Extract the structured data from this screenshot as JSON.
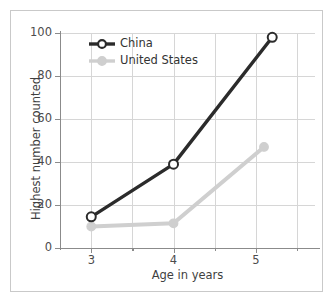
{
  "chart_data": {
    "type": "line",
    "title": "",
    "xlabel": "Age in years",
    "ylabel": "Highest number counted",
    "x": [
      3,
      4,
      5.2
    ],
    "xlim": [
      2.62,
      5.72
    ],
    "ylim": [
      0,
      100
    ],
    "xticks": [
      3,
      4,
      5
    ],
    "xticklabels": [
      "3",
      "4",
      "5"
    ],
    "xticks_minor": [
      3.5,
      4.5,
      5.5
    ],
    "yticks": [
      0,
      20,
      40,
      60,
      80,
      100
    ],
    "yticklabels": [
      "0",
      "20",
      "40",
      "60",
      "80",
      "100"
    ],
    "grid": true,
    "grid_axis": "both",
    "legend_position": "upper left",
    "series": [
      {
        "name": "China",
        "x": [
          3,
          4,
          5.2
        ],
        "values": [
          14.5,
          39,
          98
        ],
        "color": "#2b2b2b",
        "marker": "open-circle"
      },
      {
        "name": "United States",
        "x": [
          3,
          4,
          5.1
        ],
        "values": [
          10,
          11.5,
          47
        ],
        "color": "#cfcfcf",
        "marker": "filled-circle"
      }
    ]
  },
  "legend": {
    "entries": [
      {
        "label": "China"
      },
      {
        "label": "United States"
      }
    ]
  },
  "axes": {
    "y_title": "Highest number counted",
    "x_title": "Age in years",
    "y_tick_labels": [
      "100",
      "80",
      "60",
      "40",
      "20",
      "0"
    ],
    "x_tick_labels": [
      "3",
      "4",
      "5"
    ]
  },
  "colors": {
    "china_line": "#2b2b2b",
    "us_line": "#cfcfcf",
    "gridline": "#d6d6d6",
    "axis": "#8b8b8b",
    "frame": "#c9c9c9",
    "text": "#3f3f3f",
    "background": "#ffffff"
  }
}
